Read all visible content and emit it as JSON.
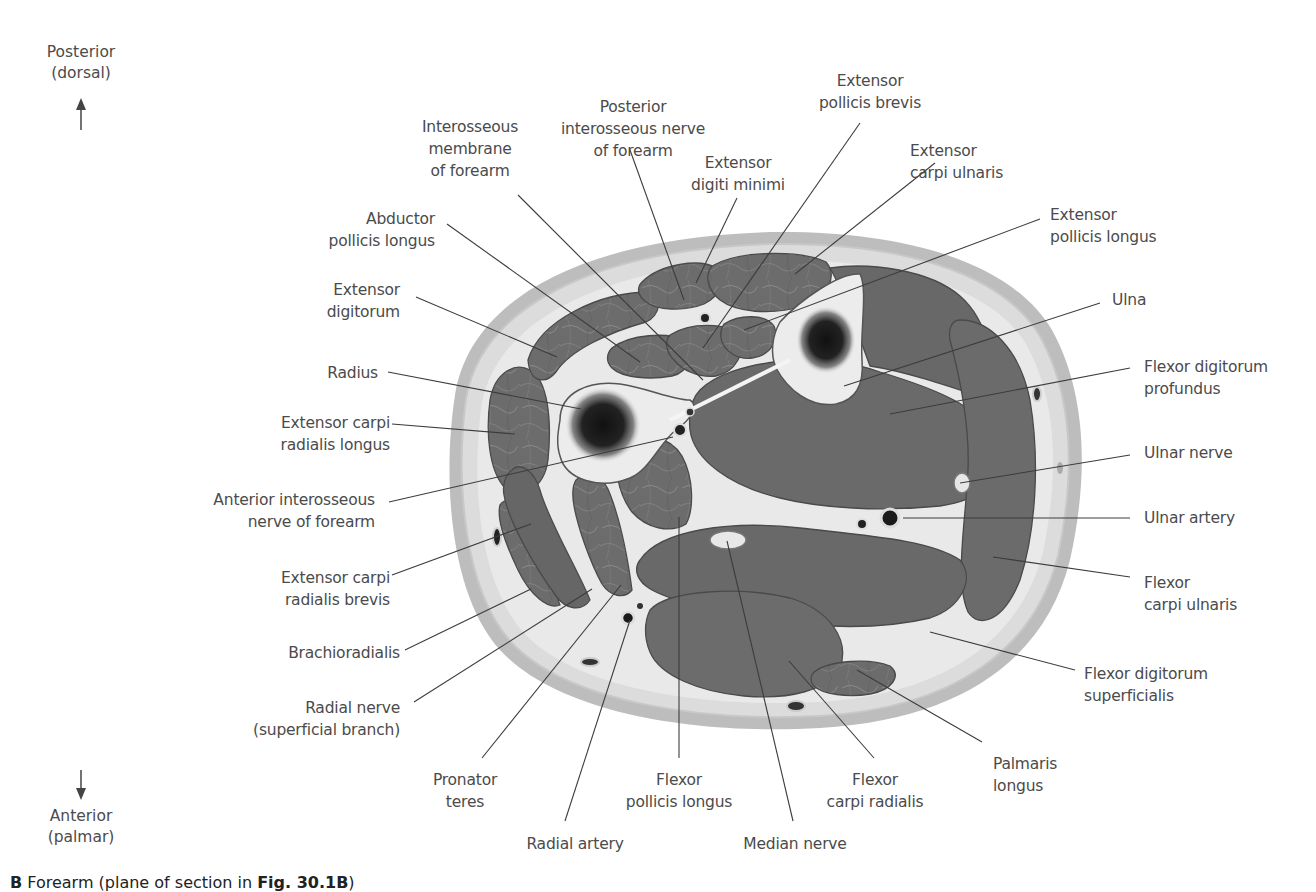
{
  "figure": {
    "caption_prefix": "B",
    "caption_text": "Forearm (plane of section in ",
    "caption_ref": "Fig. 30.1B",
    "caption_suffix": ")"
  },
  "orientation": {
    "top": "Posterior\n(dorsal)",
    "bottom": "Anterior\n(palmar)"
  },
  "colors": {
    "muscle": "#6e6e6e",
    "muscle_dark": "#575757",
    "fascia": "#e6e6e6",
    "skin_outer": "#bdbdbd",
    "subcutaneous": "#d9d9d9",
    "bone": "#ececec",
    "marrow": "#1e1e1e",
    "leader_line": "#3c3c3c",
    "label_text": "#4b4b4b"
  },
  "labels": [
    {
      "id": "posterior-interosseous-nerve",
      "text": "Posterior\ninterosseous nerve\nof forearm",
      "x": 548,
      "y": 96,
      "align": "center",
      "w": 170,
      "line": [
        [
          630,
          150
        ],
        [
          684,
          300
        ]
      ]
    },
    {
      "id": "interosseous-membrane",
      "text": "Interosseous\nmembrane\nof forearm",
      "x": 400,
      "y": 116,
      "align": "center",
      "w": 140,
      "line": [
        [
          518,
          195
        ],
        [
          703,
          380
        ]
      ]
    },
    {
      "id": "extensor-digiti-minimi",
      "text": "Extensor\ndigiti minimi",
      "x": 673,
      "y": 152,
      "align": "center",
      "w": 130,
      "line": [
        [
          737,
          198
        ],
        [
          696,
          283
        ]
      ]
    },
    {
      "id": "extensor-pollicis-brevis",
      "text": "Extensor\npollicis brevis",
      "x": 800,
      "y": 70,
      "align": "center",
      "w": 140,
      "line": [
        [
          860,
          123
        ],
        [
          703,
          348
        ]
      ]
    },
    {
      "id": "extensor-carpi-ulnaris",
      "text": "Extensor\ncarpi ulnaris",
      "x": 910,
      "y": 140,
      "align": "left",
      "w": 140,
      "line": [
        [
          935,
          163
        ],
        [
          795,
          274
        ]
      ]
    },
    {
      "id": "extensor-pollicis-longus",
      "text": "Extensor\npollicis longus",
      "x": 1050,
      "y": 204,
      "align": "left",
      "w": 160,
      "line": [
        [
          1040,
          219
        ],
        [
          744,
          330
        ]
      ]
    },
    {
      "id": "abductor-pollicis-longus",
      "text": "Abductor\npollicis longus",
      "x": 300,
      "y": 208,
      "align": "right",
      "w": 135,
      "line": [
        [
          447,
          224
        ],
        [
          640,
          362
        ]
      ]
    },
    {
      "id": "ulna",
      "text": "Ulna",
      "x": 1112,
      "y": 289,
      "align": "left",
      "w": 60,
      "line": [
        [
          1100,
          303
        ],
        [
          844,
          386
        ]
      ]
    },
    {
      "id": "extensor-digitorum",
      "text": "Extensor\ndigitorum",
      "x": 300,
      "y": 279,
      "align": "right",
      "w": 100,
      "line": [
        [
          416,
          297
        ],
        [
          557,
          357
        ]
      ]
    },
    {
      "id": "flexor-digitorum-profundus",
      "text": "Flexor digitorum\nprofundus",
      "x": 1144,
      "y": 356,
      "align": "left",
      "w": 160,
      "line": [
        [
          1130,
          368
        ],
        [
          890,
          414
        ]
      ]
    },
    {
      "id": "radius",
      "text": "Radius",
      "x": 310,
      "y": 362,
      "align": "right",
      "w": 68,
      "line": [
        [
          388,
          372
        ],
        [
          581,
          409
        ]
      ]
    },
    {
      "id": "extensor-carpi-radialis-longus",
      "text": "Extensor carpi\nradialis longus",
      "x": 250,
      "y": 412,
      "align": "right",
      "w": 140,
      "line": [
        [
          392,
          424
        ],
        [
          515,
          434
        ]
      ]
    },
    {
      "id": "ulnar-nerve",
      "text": "Ulnar nerve",
      "x": 1144,
      "y": 442,
      "align": "left",
      "w": 110,
      "line": [
        [
          1130,
          455
        ],
        [
          960,
          483
        ]
      ]
    },
    {
      "id": "anterior-interosseous-nerve",
      "text": "Anterior interosseous\nnerve of forearm",
      "x": 180,
      "y": 489,
      "align": "right",
      "w": 195,
      "line": [
        [
          389,
          502
        ],
        [
          673,
          437
        ]
      ]
    },
    {
      "id": "ulnar-artery",
      "text": "Ulnar artery",
      "x": 1144,
      "y": 507,
      "align": "left",
      "w": 120,
      "line": [
        [
          1130,
          518
        ],
        [
          903,
          518
        ]
      ]
    },
    {
      "id": "extensor-carpi-radialis-brevis",
      "text": "Extensor carpi\nradialis brevis",
      "x": 250,
      "y": 567,
      "align": "right",
      "w": 140,
      "line": [
        [
          392,
          575
        ],
        [
          531,
          524
        ]
      ]
    },
    {
      "id": "flexor-carpi-ulnaris",
      "text": "Flexor\ncarpi ulnaris",
      "x": 1144,
      "y": 572,
      "align": "left",
      "w": 130,
      "line": [
        [
          1130,
          577
        ],
        [
          993,
          557
        ]
      ]
    },
    {
      "id": "brachioradialis",
      "text": "Brachioradialis",
      "x": 250,
      "y": 642,
      "align": "right",
      "w": 150,
      "line": [
        [
          405,
          650
        ],
        [
          531,
          589
        ]
      ]
    },
    {
      "id": "flexor-digitorum-superficialis",
      "text": "Flexor digitorum\nsuperficialis",
      "x": 1084,
      "y": 663,
      "align": "left",
      "w": 160,
      "line": [
        [
          1075,
          670
        ],
        [
          930,
          632
        ]
      ]
    },
    {
      "id": "radial-nerve",
      "text": "Radial nerve\n(superficial branch)",
      "x": 215,
      "y": 697,
      "align": "right",
      "w": 185,
      "line": [
        [
          414,
          702
        ],
        [
          592,
          589
        ]
      ]
    },
    {
      "id": "palmaris-longus",
      "text": "Palmaris\nlongus",
      "x": 993,
      "y": 753,
      "align": "left",
      "w": 100,
      "line": [
        [
          982,
          742
        ],
        [
          857,
          670
        ]
      ]
    },
    {
      "id": "pronator-teres",
      "text": "Pronator\nteres",
      "x": 420,
      "y": 769,
      "align": "center",
      "w": 90,
      "line": [
        [
          482,
          758
        ],
        [
          621,
          585
        ]
      ]
    },
    {
      "id": "flexor-pollicis-longus",
      "text": "Flexor\npollicis longus",
      "x": 609,
      "y": 769,
      "align": "center",
      "w": 140,
      "line": [
        [
          679,
          758
        ],
        [
          679,
          517
        ]
      ]
    },
    {
      "id": "flexor-carpi-radialis",
      "text": "Flexor\ncarpi radialis",
      "x": 810,
      "y": 769,
      "align": "center",
      "w": 130,
      "line": [
        [
          874,
          758
        ],
        [
          789,
          661
        ]
      ]
    },
    {
      "id": "radial-artery",
      "text": "Radial artery",
      "x": 510,
      "y": 833,
      "align": "center",
      "w": 130,
      "line": [
        [
          565,
          821
        ],
        [
          630,
          620
        ]
      ]
    },
    {
      "id": "median-nerve",
      "text": "Median nerve",
      "x": 730,
      "y": 833,
      "align": "center",
      "w": 130,
      "line": [
        [
          793,
          821
        ],
        [
          727,
          541
        ]
      ]
    }
  ]
}
